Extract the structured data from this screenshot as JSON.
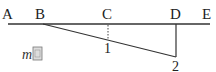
{
  "diagram": {
    "points": {
      "A": "A",
      "B": "B",
      "C": "C",
      "D": "D",
      "E": "E"
    },
    "markers": {
      "one": "1",
      "two": "2"
    },
    "note": {
      "letter": "m",
      "glyph": "圖"
    },
    "colors": {
      "line": "#333333",
      "text": "#222222"
    }
  }
}
